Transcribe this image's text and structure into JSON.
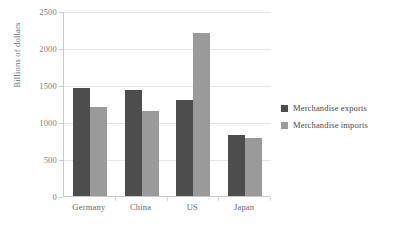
{
  "chart_data": {
    "type": "bar",
    "title": "",
    "xlabel": "",
    "ylabel": "Billions of dollars",
    "categories": [
      "Germany",
      "China",
      "US",
      "Japan"
    ],
    "series": [
      {
        "name": "Merchandise exports",
        "color": "#4d4d4d",
        "values": [
          1460,
          1430,
          1300,
          825
        ]
      },
      {
        "name": "Merchandise imports",
        "color": "#9a9a9a",
        "values": [
          1200,
          1150,
          2200,
          785
        ]
      }
    ],
    "ylim": [
      0,
      2500
    ],
    "yticks": [
      0,
      500,
      1000,
      1500,
      2000,
      2500
    ],
    "ytick_labels": [
      "0",
      "500",
      "1000",
      "1500",
      "2000",
      "2500"
    ],
    "grid": true,
    "legend_position": "right",
    "background_color": "#ffffff",
    "gridline_color": "#e4e4e4",
    "axis_color": "#c9c9c9"
  },
  "legend": {
    "items": [
      {
        "label": "Merchandise exports",
        "color": "#4d4d4d"
      },
      {
        "label": "Merchandise imports",
        "color": "#9a9a9a"
      }
    ]
  }
}
